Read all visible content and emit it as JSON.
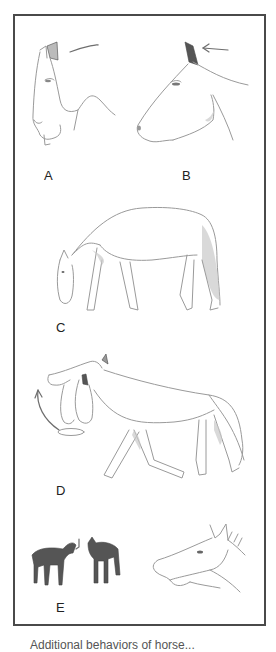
{
  "figure": {
    "border_color": "#4a4a4a",
    "panels": [
      {
        "id": "A",
        "label": "A",
        "description": "Horse head in profile, ears pinned back, tense muzzle"
      },
      {
        "id": "B",
        "label": "B",
        "description": "Horse head in profile, ears back, arrow indicating ear direction"
      },
      {
        "id": "C",
        "label": "C",
        "description": "Horse grazing posture, head lowered"
      },
      {
        "id": "D",
        "label": "D",
        "description": "Horse walking with head swinging in circular motion (arrow)"
      },
      {
        "id": "E",
        "label": "E",
        "description": "Two dark horses facing each other, plus foal head with open mouth (snapping)"
      }
    ],
    "caption": "Additional behaviors of horse..."
  }
}
